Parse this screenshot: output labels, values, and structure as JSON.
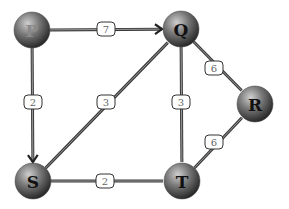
{
  "diagram": {
    "type": "weighted-graph",
    "nodes": [
      {
        "id": "P",
        "label": "P",
        "x": 32,
        "y": 30,
        "r": 18,
        "label_faint": true
      },
      {
        "id": "Q",
        "label": "Q",
        "x": 181,
        "y": 29,
        "r": 18,
        "label_faint": false
      },
      {
        "id": "R",
        "label": "R",
        "x": 255,
        "y": 104,
        "r": 18,
        "label_faint": false
      },
      {
        "id": "S",
        "label": "S",
        "x": 33,
        "y": 181,
        "r": 18,
        "label_faint": false
      },
      {
        "id": "T",
        "label": "T",
        "x": 182,
        "y": 181,
        "r": 18,
        "label_faint": false
      }
    ],
    "edges": [
      {
        "from": "P",
        "to": "Q",
        "weight": "7",
        "directed": true,
        "label_x": 106,
        "label_y": 29
      },
      {
        "from": "P",
        "to": "S",
        "weight": "2",
        "directed": true,
        "label_x": 33,
        "label_y": 102
      },
      {
        "from": "S",
        "to": "Q",
        "weight": "3",
        "directed": false,
        "label_x": 106,
        "label_y": 102
      },
      {
        "from": "Q",
        "to": "T",
        "weight": "3",
        "directed": false,
        "label_x": 181,
        "label_y": 102
      },
      {
        "from": "Q",
        "to": "R",
        "weight": "6",
        "directed": false,
        "label_x": 214,
        "label_y": 68
      },
      {
        "from": "T",
        "to": "R",
        "weight": "6",
        "directed": false,
        "label_x": 214,
        "label_y": 142
      },
      {
        "from": "S",
        "to": "T",
        "weight": "2",
        "directed": false,
        "label_x": 105,
        "label_y": 181
      }
    ]
  },
  "colors": {
    "edge": "#3a3a3a",
    "node_light": "#bdbdbd",
    "node_dark": "#2e2e2e",
    "label_border": "#333333",
    "label_text": "#666666"
  }
}
